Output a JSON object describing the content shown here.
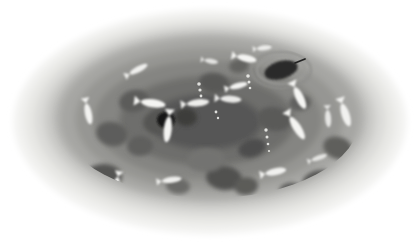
{
  "image": {
    "title": "Top-down grayscale illustration of an oval pond basin with fish and lily pads",
    "width": 420,
    "height": 248,
    "background_color": "#ffffff",
    "style": "soft-edged grayscale raster, blurred concentric bands"
  },
  "palette": {
    "background": "#ffffff",
    "rim_outer": "#f2f2f0",
    "rim_band_2": "#e6e6e3",
    "rim_band_3": "#d8d8d5",
    "rim_band_4": "#c4c4c1",
    "water_outer": "#a9a9a6",
    "water_mid": "#949491",
    "water_inner": "#7e7e7b",
    "water_core": "#636360",
    "water_deep": "#515150",
    "lily_pad": "#5e5e5c",
    "lily_pad_dark": "#4a4a49",
    "leaf_darkest": "#1d1d1c",
    "fish_light": "#f4f4f2",
    "fish_mid": "#e0e0dd",
    "bubble": "#ededea",
    "seam_line": "#e9e9e6"
  },
  "structure": {
    "basin_label": "oval pond basin",
    "rim_band_count": 5,
    "water_zone_count": 5,
    "center_x": 210,
    "center_y": 122,
    "outer_rx": 196,
    "outer_ry": 112
  },
  "rim_bands": [
    {
      "name": "rim-band-outer",
      "rx": 196,
      "ry": 112,
      "cx": 210,
      "cy": 122,
      "color": "#f2f2f0"
    },
    {
      "name": "rim-band-2",
      "rx": 186,
      "ry": 104,
      "cx": 210,
      "cy": 121,
      "color": "#e8e8e5"
    },
    {
      "name": "rim-band-3",
      "rx": 176,
      "ry": 97,
      "cx": 210,
      "cy": 120,
      "color": "#dcdcd9"
    },
    {
      "name": "rim-band-4",
      "rx": 166,
      "ry": 91,
      "cx": 210,
      "cy": 119,
      "color": "#cbcbc8"
    },
    {
      "name": "rim-band-5",
      "rx": 157,
      "ry": 85,
      "cx": 210,
      "cy": 118,
      "color": "#b6b6b3"
    }
  ],
  "water_zones": [
    {
      "name": "water-zone-outer",
      "rx": 150,
      "ry": 80,
      "cx": 210,
      "cy": 118,
      "color": "#a6a6a3"
    },
    {
      "name": "water-zone-2",
      "rx": 134,
      "ry": 71,
      "cx": 209,
      "cy": 119,
      "color": "#969693"
    },
    {
      "name": "water-zone-3",
      "rx": 114,
      "ry": 60,
      "cx": 208,
      "cy": 120,
      "color": "#858582"
    },
    {
      "name": "water-zone-4",
      "rx": 88,
      "ry": 45,
      "cx": 207,
      "cy": 121,
      "color": "#6e6e6c"
    },
    {
      "name": "water-zone-core",
      "rx": 56,
      "ry": 28,
      "cx": 206,
      "cy": 122,
      "color": "#575756"
    }
  ],
  "lily_pads": [
    {
      "id": "pad-1",
      "cx": 134,
      "cy": 101,
      "rx": 15,
      "ry": 11,
      "rot": -12,
      "color": "#5c5c5a"
    },
    {
      "id": "pad-2",
      "cx": 160,
      "cy": 122,
      "rx": 17,
      "ry": 12,
      "rot": -6,
      "color": "#555553"
    },
    {
      "id": "pad-3",
      "cx": 186,
      "cy": 117,
      "rx": 11,
      "ry": 9,
      "rot": 4,
      "color": "#3c3c3b"
    },
    {
      "id": "pad-4",
      "cx": 214,
      "cy": 83,
      "rx": 15,
      "ry": 10,
      "rot": 8,
      "color": "#595957"
    },
    {
      "id": "pad-5",
      "cx": 239,
      "cy": 66,
      "rx": 10,
      "ry": 7,
      "rot": -10,
      "color": "#636361"
    },
    {
      "id": "pad-6",
      "cx": 274,
      "cy": 119,
      "rx": 17,
      "ry": 12,
      "rot": 10,
      "color": "#5a5a58"
    },
    {
      "id": "pad-7",
      "cx": 300,
      "cy": 103,
      "rx": 11,
      "ry": 8,
      "rot": -8,
      "color": "#60605e"
    },
    {
      "id": "pad-8",
      "cx": 112,
      "cy": 134,
      "rx": 16,
      "ry": 12,
      "rot": 14,
      "color": "#5d5d5b"
    },
    {
      "id": "pad-9",
      "cx": 140,
      "cy": 146,
      "rx": 13,
      "ry": 10,
      "rot": -4,
      "color": "#5f5f5d"
    },
    {
      "id": "pad-10",
      "cx": 102,
      "cy": 178,
      "rx": 20,
      "ry": 14,
      "rot": -8,
      "color": "#545452"
    },
    {
      "id": "pad-11",
      "cx": 224,
      "cy": 178,
      "rx": 18,
      "ry": 12,
      "rot": 6,
      "color": "#515150"
    },
    {
      "id": "pad-12",
      "cx": 246,
      "cy": 186,
      "rx": 12,
      "ry": 9,
      "rot": -6,
      "color": "#5b5b59"
    },
    {
      "id": "pad-13",
      "cx": 294,
      "cy": 193,
      "rx": 15,
      "ry": 10,
      "rot": 12,
      "color": "#5a5a58"
    },
    {
      "id": "pad-14",
      "cx": 320,
      "cy": 182,
      "rx": 18,
      "ry": 12,
      "rot": -10,
      "color": "#565654"
    },
    {
      "id": "pad-15",
      "cx": 338,
      "cy": 148,
      "rx": 15,
      "ry": 11,
      "rot": 18,
      "color": "#5e5e5c"
    },
    {
      "id": "pad-16",
      "cx": 206,
      "cy": 160,
      "rx": 19,
      "ry": 12,
      "rot": -3,
      "color": "#737371"
    },
    {
      "id": "pad-17",
      "cx": 252,
      "cy": 148,
      "rx": 14,
      "ry": 9,
      "rot": -16,
      "color": "#4e4e4d"
    },
    {
      "id": "pad-18",
      "cx": 178,
      "cy": 186,
      "rx": 12,
      "ry": 8,
      "rot": 6,
      "color": "#6a6a68"
    }
  ],
  "dark_leaf": {
    "id": "floating-leaf",
    "cx": 281,
    "cy": 70,
    "rx": 17,
    "ry": 9,
    "rot": -16,
    "color": "#2a2a29",
    "ripple_rings": [
      {
        "rx": 24,
        "ry": 14,
        "color": "#9a9a97"
      },
      {
        "rx": 30,
        "ry": 18,
        "color": "#8e8e8b"
      }
    ],
    "stem": {
      "x1": 295,
      "y1": 63,
      "x2": 305,
      "y2": 59,
      "color": "#242423"
    }
  },
  "dark_blob": {
    "id": "dark-spot",
    "cx": 166,
    "cy": 120,
    "rx": 9,
    "ry": 8,
    "color": "#171716"
  },
  "fish": [
    {
      "id": "fish-1",
      "cx": 88,
      "cy": 112,
      "len": 17,
      "h": 7,
      "rot": 78,
      "color": "#f2f2f0"
    },
    {
      "id": "fish-2",
      "cx": 137,
      "cy": 70,
      "len": 16,
      "h": 6,
      "rot": -28,
      "color": "#efefed"
    },
    {
      "id": "fish-3",
      "cx": 151,
      "cy": 103,
      "len": 20,
      "h": 8,
      "rot": 8,
      "color": "#f4f4f2"
    },
    {
      "id": "fish-4",
      "cx": 168,
      "cy": 127,
      "len": 21,
      "h": 8,
      "rot": 96,
      "color": "#f3f3f1"
    },
    {
      "id": "fish-5",
      "cx": 196,
      "cy": 103,
      "len": 18,
      "h": 7,
      "rot": -6,
      "color": "#ededeb"
    },
    {
      "id": "fish-6",
      "cx": 229,
      "cy": 99,
      "len": 17,
      "h": 7,
      "rot": 4,
      "color": "#e9e9e7"
    },
    {
      "id": "fish-7",
      "cx": 237,
      "cy": 86,
      "len": 15,
      "h": 6,
      "rot": -14,
      "color": "#f2f2f0"
    },
    {
      "id": "fish-8",
      "cx": 245,
      "cy": 58,
      "len": 16,
      "h": 7,
      "rot": 12,
      "color": "#f4f4f2"
    },
    {
      "id": "fish-9",
      "cx": 263,
      "cy": 48,
      "len": 12,
      "h": 5,
      "rot": -6,
      "color": "#ebebe9"
    },
    {
      "id": "fish-10",
      "cx": 299,
      "cy": 96,
      "len": 19,
      "h": 8,
      "rot": 64,
      "color": "#f5f5f3"
    },
    {
      "id": "fish-11",
      "cx": 296,
      "cy": 126,
      "len": 21,
      "h": 8,
      "rot": 58,
      "color": "#f4f4f2"
    },
    {
      "id": "fish-12",
      "cx": 345,
      "cy": 113,
      "len": 19,
      "h": 8,
      "rot": 72,
      "color": "#f1f1ef"
    },
    {
      "id": "fish-13",
      "cx": 274,
      "cy": 172,
      "len": 17,
      "h": 7,
      "rot": -12,
      "color": "#f0f0ee"
    },
    {
      "id": "fish-14",
      "cx": 328,
      "cy": 117,
      "len": 14,
      "h": 6,
      "rot": 86,
      "color": "#e6e6e4"
    },
    {
      "id": "fish-15",
      "cx": 116,
      "cy": 186,
      "len": 18,
      "h": 7,
      "rot": 102,
      "color": "#f4f4f2"
    },
    {
      "id": "fish-16",
      "cx": 170,
      "cy": 180,
      "len": 16,
      "h": 6,
      "rot": -8,
      "color": "#eeeeec"
    },
    {
      "id": "fish-17",
      "cx": 201,
      "cy": 205,
      "len": 16,
      "h": 6,
      "rot": 4,
      "color": "#eeeeec"
    },
    {
      "id": "fish-18",
      "cx": 252,
      "cy": 202,
      "len": 14,
      "h": 6,
      "rot": -10,
      "color": "#eaeae8"
    },
    {
      "id": "fish-19",
      "cx": 288,
      "cy": 200,
      "len": 15,
      "h": 6,
      "rot": 8,
      "color": "#efefed"
    },
    {
      "id": "fish-20",
      "cx": 318,
      "cy": 158,
      "len": 13,
      "h": 5,
      "rot": -20,
      "color": "#e4e4e2"
    },
    {
      "id": "fish-21",
      "cx": 210,
      "cy": 61,
      "len": 11,
      "h": 5,
      "rot": 10,
      "color": "#e2e2e0"
    },
    {
      "id": "fish-22",
      "cx": 353,
      "cy": 170,
      "len": 12,
      "h": 5,
      "rot": 30,
      "color": "#e8e8e6"
    }
  ],
  "bubble_trails": [
    {
      "id": "bubble-trail-left",
      "bubbles": [
        {
          "cx": 199,
          "cy": 84,
          "r": 1.8
        },
        {
          "cx": 200,
          "cy": 90,
          "r": 1.6
        },
        {
          "cx": 201,
          "cy": 96,
          "r": 1.4
        },
        {
          "cx": 202,
          "cy": 102,
          "r": 1.2
        }
      ]
    },
    {
      "id": "bubble-trail-right",
      "bubbles": [
        {
          "cx": 248,
          "cy": 76,
          "r": 1.8
        },
        {
          "cx": 249,
          "cy": 82,
          "r": 1.5
        },
        {
          "cx": 250,
          "cy": 88,
          "r": 1.3
        }
      ]
    },
    {
      "id": "bubble-trail-lower",
      "bubbles": [
        {
          "cx": 266,
          "cy": 130,
          "r": 1.7
        },
        {
          "cx": 267,
          "cy": 137,
          "r": 1.5
        },
        {
          "cx": 268,
          "cy": 144,
          "r": 1.3
        },
        {
          "cx": 269,
          "cy": 151,
          "r": 1.1
        }
      ]
    },
    {
      "id": "bubble-trail-center",
      "bubbles": [
        {
          "cx": 216,
          "cy": 112,
          "r": 1.4
        },
        {
          "cx": 218,
          "cy": 118,
          "r": 1.2
        }
      ]
    }
  ],
  "seam": {
    "id": "vertical-seam-line",
    "x": 207,
    "y1": 12,
    "y2": 238,
    "color": "#e9e9e6",
    "width": 1.4,
    "opacity": 0.5
  }
}
